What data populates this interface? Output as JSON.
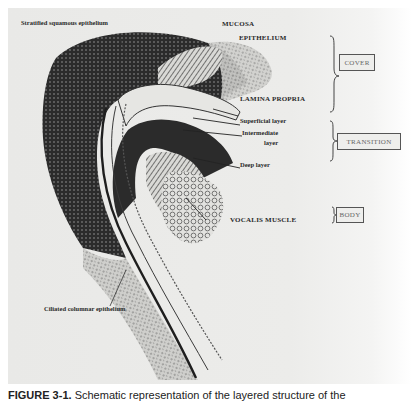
{
  "figure": {
    "labels": {
      "stratified": "Stratified squamous epithelium",
      "mucosa": "MUCOSA",
      "epithelium": "EPITHELIUM",
      "lamina_propria": "LAMINA PROPRIA",
      "superficial": "Superficial layer",
      "intermediate_1": "Intermediate",
      "intermediate_2": "layer",
      "deep": "Deep layer",
      "vocalis": "VOCALIS MUSCLE",
      "ciliated": "Ciliated columnar epithelium"
    },
    "groups": {
      "cover": "COVER",
      "transition": "TRANSITION",
      "body": "BODY"
    }
  },
  "caption": {
    "number": "FIGURE 3-1.",
    "text": "Schematic representation of the layered structure of the"
  }
}
